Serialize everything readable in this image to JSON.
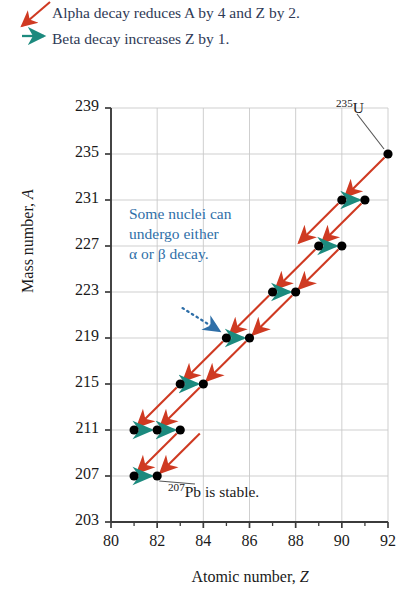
{
  "legend": {
    "alpha_text": "Alpha decay reduces A by 4 and Z by 2.",
    "beta_text": "Beta decay increases Z by 1.",
    "alpha_arrow_color": "#cf3a22",
    "beta_arrow_color": "#1c8a7e",
    "text_color": "#2f3a56"
  },
  "annotations": {
    "note_line1": "Some nuclei can",
    "note_line2": "undergo either",
    "note_line3": "α or β decay.",
    "note_color": "#2f6fa8",
    "u235_sup": "235",
    "u235_sym": "U",
    "pb207_sup": "207",
    "pb207_text": "Pb is stable."
  },
  "chart_data": {
    "type": "scatter",
    "title": "",
    "xlabel": "Atomic number, Z",
    "ylabel": "Mass number, A",
    "xlim": [
      80,
      92
    ],
    "ylim": [
      203,
      239
    ],
    "xticks": [
      80,
      82,
      84,
      86,
      88,
      90,
      92
    ],
    "xticklabels": [
      "80",
      "82",
      "84",
      "86",
      "88",
      "90",
      "92"
    ],
    "xminorticks": [
      81,
      83,
      85,
      87,
      89,
      91
    ],
    "yticks": [
      203,
      207,
      211,
      215,
      219,
      223,
      227,
      231,
      235,
      239
    ],
    "yticklabels": [
      "203",
      "207",
      "211",
      "215",
      "219",
      "223",
      "227",
      "231",
      "235",
      "239"
    ],
    "grid": true,
    "grid_color": "#c9c9c9",
    "axis_color": "#3b3b3b",
    "point_color": "#000000",
    "points": [
      {
        "Z": 92,
        "A": 235,
        "label": "235U"
      },
      {
        "Z": 90,
        "A": 231,
        "label": ""
      },
      {
        "Z": 91,
        "A": 231,
        "label": ""
      },
      {
        "Z": 89,
        "A": 227,
        "label": ""
      },
      {
        "Z": 90,
        "A": 227,
        "label": ""
      },
      {
        "Z": 87,
        "A": 223,
        "label": ""
      },
      {
        "Z": 88,
        "A": 223,
        "label": ""
      },
      {
        "Z": 85,
        "A": 219,
        "label": ""
      },
      {
        "Z": 86,
        "A": 219,
        "label": ""
      },
      {
        "Z": 83,
        "A": 215,
        "label": ""
      },
      {
        "Z": 84,
        "A": 215,
        "label": ""
      },
      {
        "Z": 81,
        "A": 211,
        "label": ""
      },
      {
        "Z": 82,
        "A": 211,
        "label": ""
      },
      {
        "Z": 83,
        "A": 211,
        "label": ""
      },
      {
        "Z": 81,
        "A": 207,
        "label": ""
      },
      {
        "Z": 82,
        "A": 207,
        "label": "207Pb"
      }
    ],
    "alpha_decays": [
      {
        "from": [
          92,
          235
        ],
        "to": [
          90,
          231
        ]
      },
      {
        "from": [
          91,
          231
        ],
        "to": [
          89,
          227
        ]
      },
      {
        "from": [
          90,
          231
        ],
        "to": [
          88,
          227
        ]
      },
      {
        "from": [
          90,
          227
        ],
        "to": [
          88,
          223
        ]
      },
      {
        "from": [
          89,
          227
        ],
        "to": [
          87,
          223
        ]
      },
      {
        "from": [
          88,
          223
        ],
        "to": [
          86,
          219
        ]
      },
      {
        "from": [
          87,
          223
        ],
        "to": [
          85,
          219
        ]
      },
      {
        "from": [
          86,
          219
        ],
        "to": [
          84,
          215
        ]
      },
      {
        "from": [
          85,
          219
        ],
        "to": [
          83,
          215
        ]
      },
      {
        "from": [
          84,
          215
        ],
        "to": [
          82,
          211
        ]
      },
      {
        "from": [
          83,
          215
        ],
        "to": [
          81,
          211
        ]
      },
      {
        "from": [
          83,
          211
        ],
        "to": [
          81,
          207
        ]
      },
      {
        "from": [
          84,
          211
        ],
        "to": [
          82,
          207
        ]
      }
    ],
    "beta_decays": [
      {
        "from": [
          90,
          231
        ],
        "to": [
          91,
          231
        ]
      },
      {
        "from": [
          89,
          227
        ],
        "to": [
          90,
          227
        ]
      },
      {
        "from": [
          87,
          223
        ],
        "to": [
          88,
          223
        ]
      },
      {
        "from": [
          85,
          219
        ],
        "to": [
          86,
          219
        ]
      },
      {
        "from": [
          83,
          215
        ],
        "to": [
          84,
          215
        ]
      },
      {
        "from": [
          81,
          211
        ],
        "to": [
          82,
          211
        ]
      },
      {
        "from": [
          82,
          211
        ],
        "to": [
          83,
          211
        ]
      },
      {
        "from": [
          81,
          207
        ],
        "to": [
          82,
          207
        ]
      }
    ],
    "callout_arrow": {
      "from": [
        83.1,
        221.6
      ],
      "to": [
        84.7,
        219.6
      ],
      "color": "#2f6fa8",
      "style": "dotted"
    },
    "series_note": "U-235 decay series: alternating alpha (A-4, Z-2) and beta (Z+1) decays ending at stable Pb-207"
  }
}
